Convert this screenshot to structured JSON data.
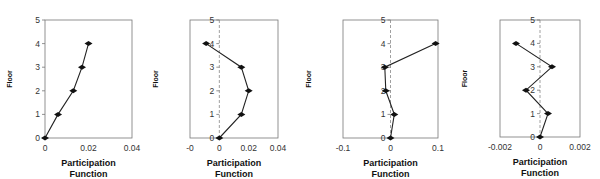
{
  "chart_data": [
    {
      "type": "line",
      "title": "",
      "xlabel": "Participation Function",
      "ylabel": "Floor",
      "xlim": [
        0,
        0.04
      ],
      "ylim": [
        0,
        5
      ],
      "xticks": [
        "0",
        "0.02",
        "0.04"
      ],
      "yticks": [
        "0",
        "1",
        "2",
        "3",
        "4",
        "5"
      ],
      "zero_line": false,
      "grid": false,
      "series": [
        {
          "name": "mode",
          "x": [
            0,
            0.006,
            0.013,
            0.017,
            0.02
          ],
          "y": [
            0,
            1,
            2,
            3,
            4
          ]
        }
      ]
    },
    {
      "type": "line",
      "title": "",
      "xlabel": "Participation Function",
      "ylabel": "Floor",
      "xlim": [
        -0.02,
        0.04
      ],
      "ylim": [
        0,
        5
      ],
      "xticks": [
        "-0",
        "0",
        "0.02",
        "0.04"
      ],
      "yticks": [
        "0",
        "1",
        "2",
        "3",
        "4",
        "5"
      ],
      "zero_line": true,
      "grid": false,
      "series": [
        {
          "name": "mode",
          "x": [
            0,
            0.015,
            0.02,
            0.015,
            -0.009
          ],
          "y": [
            0,
            1,
            2,
            3,
            4
          ]
        }
      ]
    },
    {
      "type": "line",
      "title": "",
      "xlabel": "Participation Function",
      "ylabel": "Floor",
      "xlim": [
        -0.1,
        0.1
      ],
      "ylim": [
        0,
        5
      ],
      "xticks": [
        "-0.1",
        "0",
        "0.1"
      ],
      "yticks": [
        "0",
        "1",
        "2",
        "3",
        "4",
        "5"
      ],
      "zero_line": true,
      "grid": false,
      "series": [
        {
          "name": "mode",
          "x": [
            0,
            0.008,
            -0.01,
            -0.012,
            0.095
          ],
          "y": [
            0,
            1,
            2,
            3,
            4
          ]
        }
      ]
    },
    {
      "type": "line",
      "title": "",
      "xlabel": "Participation Function",
      "ylabel": "Floor",
      "xlim": [
        -0.002,
        0.002
      ],
      "ylim": [
        0,
        5
      ],
      "xticks": [
        "-0.002",
        "0",
        "0.002"
      ],
      "yticks": [
        "0",
        "1",
        "2",
        "3",
        "4",
        "5"
      ],
      "zero_line": true,
      "grid": false,
      "series": [
        {
          "name": "mode",
          "x": [
            0,
            0.0004,
            -0.0007,
            0.0006,
            -0.0012
          ],
          "y": [
            0,
            1,
            2,
            3,
            4
          ]
        }
      ]
    }
  ],
  "labels": {
    "xlabel_line1": "Participation",
    "xlabel_line2": "Function",
    "ylabel": "Floor"
  }
}
